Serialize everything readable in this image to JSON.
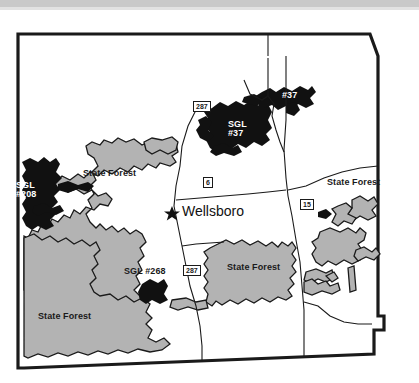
{
  "document": {
    "type": "scanned-map",
    "subject": "Tioga County Pennsylvania public lands map",
    "colors": {
      "game_lands_fill": "#111111",
      "state_forest_fill": "#b3b3b3",
      "background": "#ffffff",
      "boundary_line": "#1a1a1a",
      "scan_artifact_band": "#c9c9c9"
    }
  },
  "map": {
    "city_marker": {
      "name": "Wellsboro",
      "symbol": "star-marker"
    },
    "game_lands": [
      {
        "id": "sgl-208",
        "label_line1": "SGL",
        "label_line2": "#208",
        "text_color": "white"
      },
      {
        "id": "sgl-37",
        "label_line1": "SGL",
        "label_line2": "#37",
        "text_color": "white"
      },
      {
        "id": "sgl-37-north",
        "label_line1": "#37",
        "label_line2": "",
        "text_color": "white"
      },
      {
        "id": "sgl-268",
        "label_line1": "SGL #268",
        "label_line2": "",
        "text_color": "black"
      }
    ],
    "state_forest_labels": [
      {
        "id": "state-forest-northwest",
        "label": "State Forest"
      },
      {
        "id": "state-forest-east",
        "label": "State Forest"
      },
      {
        "id": "state-forest-central-south",
        "label": "State Forest"
      },
      {
        "id": "state-forest-southwest",
        "label": "State Forest"
      }
    ],
    "route_shields": [
      {
        "id": "route-287-north",
        "number": "287"
      },
      {
        "id": "route-6",
        "number": "6"
      },
      {
        "id": "route-15",
        "number": "15"
      },
      {
        "id": "route-287-south",
        "number": "287"
      }
    ]
  }
}
